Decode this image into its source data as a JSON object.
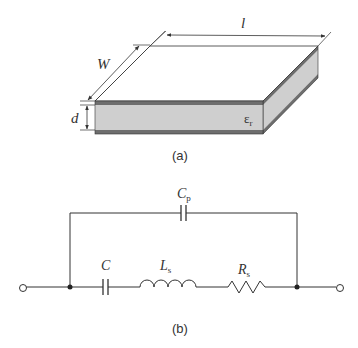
{
  "figure_a": {
    "caption": "(a)",
    "labels": {
      "length": "l",
      "width": "W",
      "thickness": "d",
      "permittivity_base": "ε",
      "permittivity_sub": "r"
    },
    "colors": {
      "electrode": "#6e6e6e",
      "dielectric": "#cfcfcf",
      "top_face": "#ffffff",
      "line": "#333333"
    }
  },
  "figure_b": {
    "caption": "(b)",
    "components": [
      {
        "id": "Cp",
        "label_base": "C",
        "label_sub": "p",
        "type": "capacitor",
        "branch": "parallel"
      },
      {
        "id": "C",
        "label_base": "C",
        "label_sub": "",
        "type": "capacitor",
        "branch": "series"
      },
      {
        "id": "Ls",
        "label_base": "L",
        "label_sub": "s",
        "type": "inductor",
        "branch": "series"
      },
      {
        "id": "Rs",
        "label_base": "R",
        "label_sub": "s",
        "type": "resistor",
        "branch": "series"
      }
    ],
    "terminals": [
      "left",
      "right"
    ]
  }
}
